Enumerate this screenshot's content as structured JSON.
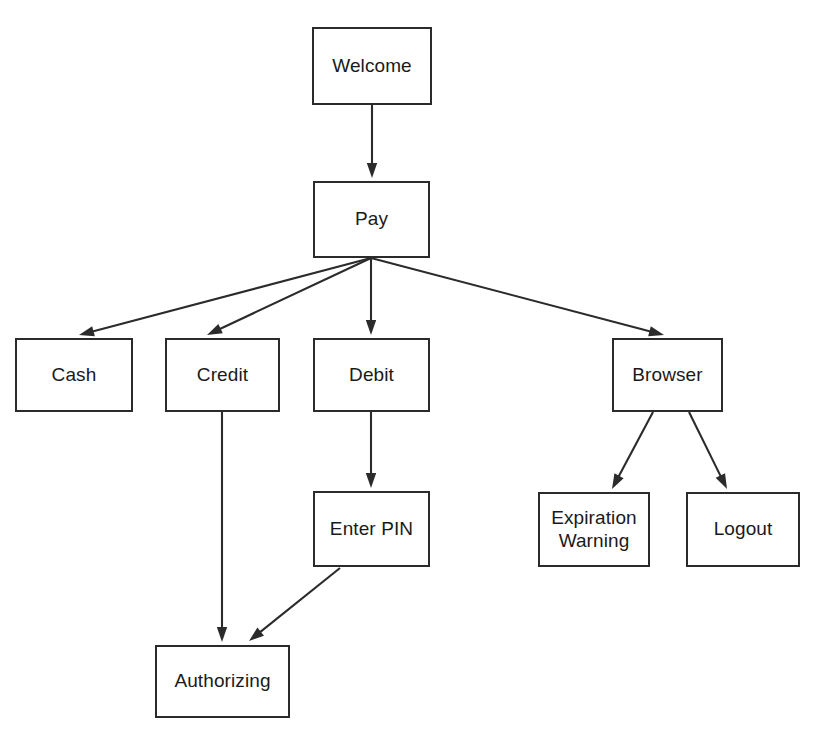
{
  "diagram": {
    "type": "flowchart",
    "canvas": {
      "width": 823,
      "height": 735
    },
    "style": {
      "background_color": "#ffffff",
      "node_fill": "#ffffff",
      "node_stroke": "#2b2b2b",
      "edge_color": "#2b2b2b",
      "text_color": "#1a1a1a"
    },
    "nodes": [
      {
        "id": "welcome",
        "label": "Welcome",
        "x": 312,
        "y": 27,
        "w": 120,
        "h": 78
      },
      {
        "id": "pay",
        "label": "Pay",
        "x": 313,
        "y": 181,
        "w": 117,
        "h": 77
      },
      {
        "id": "cash",
        "label": "Cash",
        "x": 15,
        "y": 338,
        "w": 118,
        "h": 74
      },
      {
        "id": "credit",
        "label": "Credit",
        "x": 165,
        "y": 338,
        "w": 115,
        "h": 74
      },
      {
        "id": "debit",
        "label": "Debit",
        "x": 313,
        "y": 338,
        "w": 117,
        "h": 74
      },
      {
        "id": "browser",
        "label": "Browser",
        "x": 612,
        "y": 338,
        "w": 111,
        "h": 74
      },
      {
        "id": "enter_pin",
        "label": "Enter PIN",
        "x": 313,
        "y": 491,
        "w": 117,
        "h": 76
      },
      {
        "id": "expiration_warning",
        "label": "Expiration\nWarning",
        "x": 538,
        "y": 492,
        "w": 112,
        "h": 75
      },
      {
        "id": "logout",
        "label": "Logout",
        "x": 686,
        "y": 492,
        "w": 114,
        "h": 75
      },
      {
        "id": "authorizing",
        "label": "Authorizing",
        "x": 155,
        "y": 645,
        "w": 135,
        "h": 73
      }
    ],
    "edges": [
      {
        "id": "welcome-to-pay",
        "from": "welcome",
        "to": "pay",
        "x1": 372,
        "y1": 105,
        "x2": 372,
        "y2": 178,
        "directed": true
      },
      {
        "id": "pay-to-cash",
        "from": "pay",
        "to": "cash",
        "x1": 371,
        "y1": 258,
        "x2": 79,
        "y2": 335,
        "directed": true
      },
      {
        "id": "pay-to-credit",
        "from": "pay",
        "to": "credit",
        "x1": 371,
        "y1": 258,
        "x2": 207,
        "y2": 335,
        "directed": true
      },
      {
        "id": "pay-to-debit",
        "from": "pay",
        "to": "debit",
        "x1": 371,
        "y1": 258,
        "x2": 371,
        "y2": 335,
        "directed": true
      },
      {
        "id": "pay-to-browser",
        "from": "pay",
        "to": "browser",
        "x1": 371,
        "y1": 258,
        "x2": 664,
        "y2": 335,
        "directed": true
      },
      {
        "id": "credit-to-authorizing",
        "from": "credit",
        "to": "authorizing",
        "x1": 222,
        "y1": 412,
        "x2": 222,
        "y2": 642,
        "directed": true
      },
      {
        "id": "debit-to-enter-pin",
        "from": "debit",
        "to": "enter_pin",
        "x1": 371,
        "y1": 412,
        "x2": 371,
        "y2": 488,
        "directed": true
      },
      {
        "id": "enter-pin-to-authorizing",
        "from": "enter_pin",
        "to": "authorizing",
        "x1": 340,
        "y1": 568,
        "x2": 249,
        "y2": 641,
        "directed": true
      },
      {
        "id": "browser-to-expiration",
        "from": "browser",
        "to": "expiration_warning",
        "x1": 653,
        "y1": 412,
        "x2": 612,
        "y2": 489,
        "directed": true
      },
      {
        "id": "browser-to-logout",
        "from": "browser",
        "to": "logout",
        "x1": 689,
        "y1": 412,
        "x2": 727,
        "y2": 489,
        "directed": true
      }
    ]
  }
}
